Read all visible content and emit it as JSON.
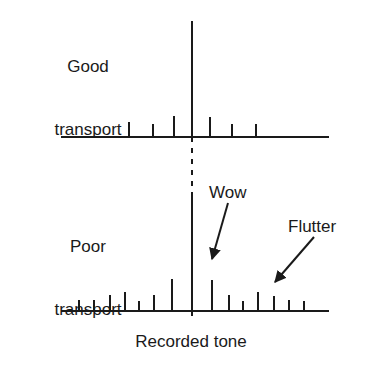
{
  "figure": {
    "title_caption": "Recorded tone",
    "axis_color": "#1a1a1a",
    "tick_color": "#1a1a1a",
    "background": "#ffffff"
  },
  "labels": {
    "good_line1": "Good",
    "good_line2": "transport",
    "poor_line1": "Poor",
    "poor_line2": "transport",
    "wow": "Wow",
    "flutter": "Flutter",
    "recorded_tone": "Recorded tone"
  },
  "chart_data": {
    "type": "bar",
    "title": "",
    "subtitle": "",
    "xlabel": "Recorded tone",
    "ylabel": "",
    "grid": false,
    "legend": null,
    "annotations": [
      {
        "text": "Wow",
        "text_x": 232,
        "text_y": 192,
        "arrow_from_x": 228,
        "arrow_from_y": 203,
        "arrow_to_x": 212,
        "arrow_to_y": 259
      },
      {
        "text": "Flutter",
        "text_x": 316,
        "text_y": 226,
        "arrow_from_x": 314,
        "arrow_from_y": 237,
        "arrow_to_x": 275,
        "arrow_to_y": 282
      }
    ],
    "panels": [
      {
        "name": "Good transport",
        "label_lines": [
          "Good",
          "transport"
        ],
        "baseline_y": 137,
        "axis_x_start": 62,
        "axis_x_end": 328,
        "center_x": 192,
        "center_spike_top_y": 21,
        "series": [
          {
            "name": "sidebands",
            "values": [
              {
                "x": 129,
                "height": 14
              },
              {
                "x": 153,
                "height": 12
              },
              {
                "x": 174,
                "height": 20
              },
              {
                "x": 210,
                "height": 19
              },
              {
                "x": 232,
                "height": 12
              },
              {
                "x": 256,
                "height": 12
              }
            ]
          }
        ]
      },
      {
        "name": "Poor transport",
        "label_lines": [
          "Poor",
          "transport"
        ],
        "baseline_y": 311,
        "axis_x_start": 62,
        "axis_x_end": 328,
        "center_x": 192,
        "center_spike_top_y": 192,
        "series": [
          {
            "name": "sidebands",
            "values": [
              {
                "x": 79,
                "height": 10
              },
              {
                "x": 94,
                "height": 10
              },
              {
                "x": 110,
                "height": 15
              },
              {
                "x": 125,
                "height": 18
              },
              {
                "x": 139,
                "height": 9
              },
              {
                "x": 154,
                "height": 15
              },
              {
                "x": 172,
                "height": 31
              },
              {
                "x": 212,
                "height": 30
              },
              {
                "x": 229,
                "height": 15
              },
              {
                "x": 243,
                "height": 9
              },
              {
                "x": 258,
                "height": 18
              },
              {
                "x": 274,
                "height": 14
              },
              {
                "x": 289,
                "height": 10
              },
              {
                "x": 304,
                "height": 9
              }
            ]
          }
        ]
      }
    ],
    "center_line": {
      "solid_top": {
        "x": 192,
        "y1": 21,
        "y2": 137
      },
      "dashed_middle": {
        "x": 192,
        "y1": 137,
        "y2": 192,
        "dash": "5,6"
      },
      "solid_bottom": {
        "x": 192,
        "y1": 192,
        "y2": 311
      },
      "dashed_foot": {
        "x": 192,
        "y1": 311,
        "y2": 322,
        "dash": "5,6"
      }
    }
  }
}
